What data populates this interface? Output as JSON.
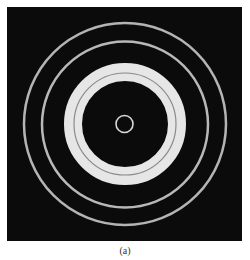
{
  "figure": {
    "caption": "(a)",
    "background_color": "#0b0b0b",
    "center": [
      125,
      124
    ],
    "rings": [
      {
        "name": "outer-ring",
        "radius": 101,
        "width": 2.5,
        "color": "#b4b4b4"
      },
      {
        "name": "second-ring",
        "radius": 83,
        "width": 2.5,
        "color": "#b8b8b8"
      },
      {
        "name": "wide-bright-ring",
        "radius": 52,
        "width": 18,
        "color": "#e6e6e6"
      },
      {
        "name": "inner-small-ring",
        "radius": 8.5,
        "width": 1.6,
        "color": "#d8d8d8"
      }
    ],
    "wide_ring_inner_dark_line": {
      "radius": 51,
      "width": 1.2,
      "color": "#8a8a8a"
    }
  }
}
